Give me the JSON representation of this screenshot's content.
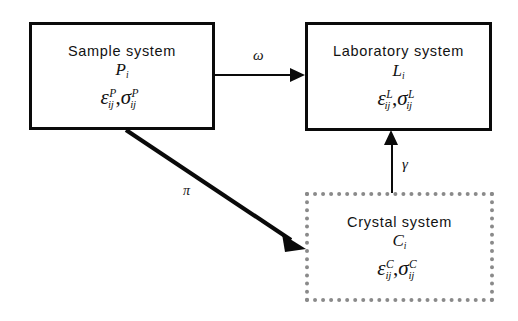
{
  "diagram": {
    "background_color": "#ffffff",
    "line_color": "#0a0a0a",
    "dotted_border_color": "#8a8a8a",
    "nodes": [
      {
        "id": "sample",
        "title": "Sample system",
        "vector": "P",
        "vector_subscript": "i",
        "tensor_strain": "ε",
        "tensor_stress": "σ",
        "tensor_subscript": "ij",
        "tensor_superscript": "P",
        "border_style": "solid"
      },
      {
        "id": "laboratory",
        "title": "Laboratory system",
        "vector": "L",
        "vector_subscript": "i",
        "tensor_strain": "ε",
        "tensor_stress": "σ",
        "tensor_subscript": "ij",
        "tensor_superscript": "L",
        "border_style": "solid"
      },
      {
        "id": "crystal",
        "title": "Crystal system",
        "vector": "C",
        "vector_subscript": "i",
        "tensor_strain": "ε",
        "tensor_stress": "σ",
        "tensor_subscript": "ij",
        "tensor_superscript": "C",
        "border_style": "dotted"
      }
    ],
    "edges": [
      {
        "id": "sample-to-laboratory",
        "label": "ω",
        "from": "sample",
        "to": "laboratory",
        "direction": "horizontal-right"
      },
      {
        "id": "sample-to-crystal",
        "label": "π",
        "from": "sample",
        "to": "crystal",
        "direction": "diagonal-down-right"
      },
      {
        "id": "crystal-to-laboratory",
        "label": "γ",
        "from": "crystal",
        "to": "laboratory",
        "direction": "vertical-up"
      }
    ],
    "comma": ","
  }
}
